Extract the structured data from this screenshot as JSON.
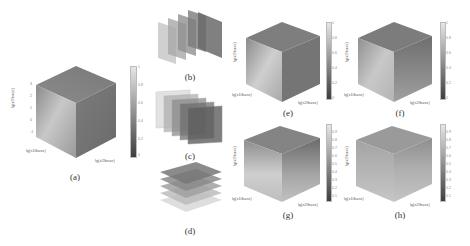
{
  "figure": {
    "panels": [
      {
        "id": "a",
        "label": "(a)"
      },
      {
        "id": "b",
        "label": "(b)"
      },
      {
        "id": "c",
        "label": "(c)"
      },
      {
        "id": "d",
        "label": "(d)"
      },
      {
        "id": "e",
        "label": "(e)"
      },
      {
        "id": "f",
        "label": "(f)"
      },
      {
        "id": "g",
        "label": "(g)"
      },
      {
        "id": "h",
        "label": "(h)"
      }
    ],
    "axes": {
      "x1": "lg(x1/base)",
      "x2": "lg(x2/base)",
      "x3": "lg(x3/base)",
      "ticks": [
        "-1",
        "0",
        "1",
        "2",
        "3"
      ]
    },
    "colorbar_a": {
      "ticks": [
        "0",
        "0.2",
        "0.4",
        "0.6",
        "0.8",
        "1"
      ]
    },
    "colorbar_ef": {
      "ticks": [
        "0",
        "0.2",
        "0.4",
        "0.6",
        "0.8",
        "1"
      ]
    },
    "colorbar_gh": {
      "ticks": [
        "0.1",
        "0.2",
        "0.3",
        "0.4",
        "0.5",
        "0.6",
        "0.7",
        "0.8",
        "0.9",
        "1"
      ]
    },
    "colors": {
      "dark": "#4a4a4a",
      "mid": "#8a8a8a",
      "light": "#d6d6d6"
    }
  }
}
